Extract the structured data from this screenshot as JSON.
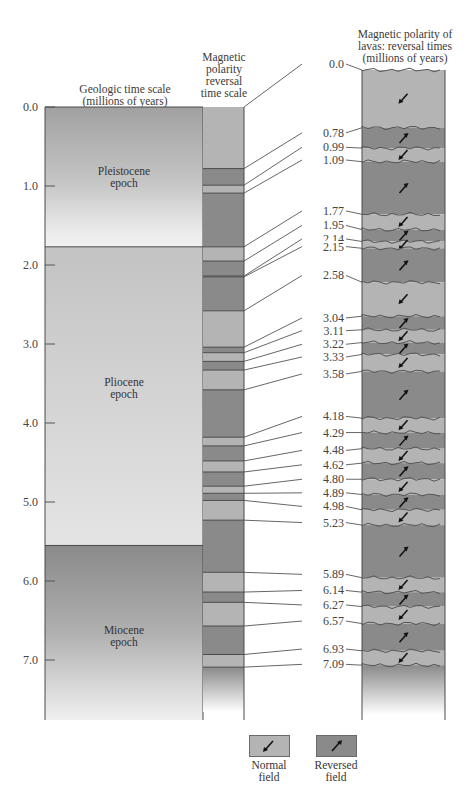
{
  "headers": {
    "geologic": [
      "Geologic time scale",
      "(millions of years)"
    ],
    "polarity": [
      "Magnetic",
      "polarity",
      "reversal",
      "time scale"
    ],
    "lavas": [
      "Magnetic polarity of",
      "lavas:  reversal times",
      "(millions of years)"
    ]
  },
  "axis": {
    "ticks": [
      "0.0",
      "1.0",
      "2.0",
      "3.0",
      "4.0",
      "5.0",
      "6.0",
      "7.0"
    ]
  },
  "epochs": [
    {
      "name": "Pleistocene",
      "sub": "epoch",
      "start": 0.0,
      "end": 1.77
    },
    {
      "name": "Pliocene",
      "sub": "epoch",
      "start": 1.77,
      "end": 5.55
    },
    {
      "name": "Miocene",
      "sub": "epoch",
      "start": 5.55,
      "end": 7.8
    }
  ],
  "reversal_times": [
    "0.0",
    "0.78",
    "0.99",
    "1.09",
    "1.77",
    "1.95",
    "2.14",
    "2.15",
    "2.58",
    "3.04",
    "3.11",
    "3.22",
    "3.33",
    "3.58",
    "4.18",
    "4.29",
    "4.48",
    "4.62",
    "4.80",
    "4.89",
    "4.98",
    "5.23",
    "5.89",
    "6.14",
    "6.27",
    "6.57",
    "6.93",
    "7.09"
  ],
  "legend": {
    "normal": {
      "line1": "Normal",
      "line2": "field",
      "icon": "arrow-down-left-icon"
    },
    "reversed": {
      "line1": "Reversed",
      "line2": "field",
      "icon": "arrow-up-right-icon"
    }
  },
  "colors": {
    "normal": "#b4b4b4",
    "reversed": "#8a8a8a",
    "pleistocene_top": "#a3a3a3",
    "pliocene": "#c9c9c9",
    "miocene_top": "#8c8c8c",
    "line": "#4a4a4a"
  },
  "chart_data": {
    "type": "table",
    "ylabel": "millions of years",
    "ylim": [
      0,
      7.8
    ],
    "epochs": [
      {
        "name": "Pleistocene epoch",
        "from": 0.0,
        "to": 1.77
      },
      {
        "name": "Pliocene epoch",
        "from": 1.77,
        "to": 5.55
      },
      {
        "name": "Miocene epoch",
        "from": 5.55,
        "to": 7.8
      }
    ],
    "polarity_intervals": [
      {
        "from": 0.0,
        "to": 0.78,
        "field": "normal"
      },
      {
        "from": 0.78,
        "to": 0.99,
        "field": "reversed"
      },
      {
        "from": 0.99,
        "to": 1.09,
        "field": "normal"
      },
      {
        "from": 1.09,
        "to": 1.77,
        "field": "reversed"
      },
      {
        "from": 1.77,
        "to": 1.95,
        "field": "normal"
      },
      {
        "from": 1.95,
        "to": 2.14,
        "field": "reversed"
      },
      {
        "from": 2.14,
        "to": 2.15,
        "field": "normal"
      },
      {
        "from": 2.15,
        "to": 2.58,
        "field": "reversed"
      },
      {
        "from": 2.58,
        "to": 3.04,
        "field": "normal"
      },
      {
        "from": 3.04,
        "to": 3.11,
        "field": "reversed"
      },
      {
        "from": 3.11,
        "to": 3.22,
        "field": "normal"
      },
      {
        "from": 3.22,
        "to": 3.33,
        "field": "reversed"
      },
      {
        "from": 3.33,
        "to": 3.58,
        "field": "normal"
      },
      {
        "from": 3.58,
        "to": 4.18,
        "field": "reversed"
      },
      {
        "from": 4.18,
        "to": 4.29,
        "field": "normal"
      },
      {
        "from": 4.29,
        "to": 4.48,
        "field": "reversed"
      },
      {
        "from": 4.48,
        "to": 4.62,
        "field": "normal"
      },
      {
        "from": 4.62,
        "to": 4.8,
        "field": "reversed"
      },
      {
        "from": 4.8,
        "to": 4.89,
        "field": "normal"
      },
      {
        "from": 4.89,
        "to": 4.98,
        "field": "reversed"
      },
      {
        "from": 4.98,
        "to": 5.23,
        "field": "normal"
      },
      {
        "from": 5.23,
        "to": 5.89,
        "field": "reversed"
      },
      {
        "from": 5.89,
        "to": 6.14,
        "field": "normal"
      },
      {
        "from": 6.14,
        "to": 6.27,
        "field": "reversed"
      },
      {
        "from": 6.27,
        "to": 6.57,
        "field": "normal"
      },
      {
        "from": 6.57,
        "to": 6.93,
        "field": "reversed"
      },
      {
        "from": 6.93,
        "to": 7.09,
        "field": "normal"
      },
      {
        "from": 7.09,
        "to": 7.8,
        "field": "reversed"
      }
    ],
    "legend": [
      "Normal field",
      "Reversed field"
    ]
  }
}
